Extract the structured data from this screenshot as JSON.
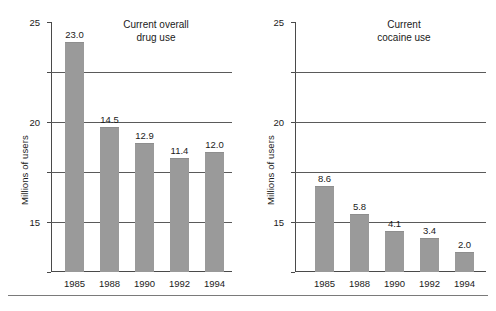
{
  "chart_data": [
    {
      "type": "bar",
      "title": "Current overall\ndrug use",
      "xlabel": "",
      "ylabel": "Millions of users",
      "categories": [
        "1985",
        "1988",
        "1990",
        "1992",
        "1994"
      ],
      "values": [
        23.0,
        14.5,
        12.9,
        11.4,
        12.0
      ],
      "value_labels": [
        "23.0",
        "14.5",
        "12.9",
        "11.4",
        "12.0"
      ],
      "ylim": [
        0,
        25
      ],
      "yticks": [
        0,
        5,
        10,
        15,
        20,
        25
      ],
      "ytick_labels": [
        "0",
        "5",
        "10",
        "15",
        "20",
        "25"
      ],
      "grid": true,
      "grid_axis": "y",
      "legend": false,
      "bar_color": "#9a9a9a"
    },
    {
      "type": "bar",
      "title": "Current\ncocaine use",
      "xlabel": "",
      "ylabel": "Millions of users",
      "categories": [
        "1985",
        "1988",
        "1990",
        "1992",
        "1994"
      ],
      "values": [
        8.6,
        5.8,
        4.1,
        3.4,
        2.0
      ],
      "value_labels": [
        "8.6",
        "5.8",
        "4.1",
        "3.4",
        "2.0"
      ],
      "ylim": [
        0,
        25
      ],
      "yticks": [
        0,
        5,
        10,
        15,
        20,
        25
      ],
      "ytick_labels": [
        "0",
        "5",
        "10",
        "15",
        "20",
        "25"
      ],
      "grid": true,
      "grid_axis": "y",
      "legend": false,
      "bar_color": "#9a9a9a"
    }
  ]
}
